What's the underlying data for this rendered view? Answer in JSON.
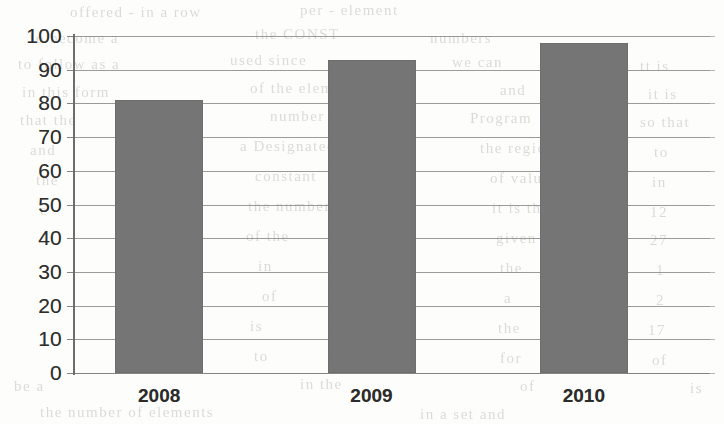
{
  "chart_data": {
    "type": "bar",
    "title": "",
    "subtitle": "",
    "xlabel": "",
    "ylabel": "",
    "categories": [
      "2008",
      "2009",
      "2010"
    ],
    "values": [
      81,
      93,
      98
    ],
    "series": [
      {
        "name": "",
        "values": [
          81,
          93,
          98
        ]
      }
    ],
    "ylim": [
      0,
      100
    ],
    "ytick_step": 10,
    "yticks": [
      100,
      90,
      80,
      70,
      60,
      50,
      40,
      30,
      20,
      10,
      0
    ],
    "ytick_labels": [
      "100",
      "90",
      "80",
      "70",
      "60",
      "50",
      "40",
      "30",
      "20",
      "10",
      "0"
    ],
    "grid": true,
    "grid_axis": "y",
    "legend": false,
    "legend_position": "none",
    "bar_color": "#757575",
    "grid_color": "#8a8a86",
    "axis_color": "#6d6d69",
    "background_color": "#fdfdfc",
    "text_color": "#2e2e2c"
  },
  "artifacts": {
    "description": "faint bleed-through text from reverse side of scanned page",
    "lines": [
      {
        "text": "offered - in a row",
        "x": 70,
        "y": 4
      },
      {
        "text": "per - element",
        "x": 300,
        "y": 2
      },
      {
        "text": "to become a",
        "x": 30,
        "y": 30
      },
      {
        "text": "the CONST",
        "x": 255,
        "y": 26
      },
      {
        "text": "numbers",
        "x": 430,
        "y": 30
      },
      {
        "text": "to follow as a",
        "x": 18,
        "y": 56
      },
      {
        "text": "used since",
        "x": 230,
        "y": 52
      },
      {
        "text": "we can",
        "x": 452,
        "y": 54
      },
      {
        "text": "tt is",
        "x": 640,
        "y": 58
      },
      {
        "text": "in this form",
        "x": 22,
        "y": 84
      },
      {
        "text": "of the element",
        "x": 250,
        "y": 80
      },
      {
        "text": "and",
        "x": 500,
        "y": 82
      },
      {
        "text": "it is",
        "x": 648,
        "y": 86
      },
      {
        "text": "that the",
        "x": 20,
        "y": 112
      },
      {
        "text": "number",
        "x": 270,
        "y": 108
      },
      {
        "text": "Program",
        "x": 470,
        "y": 110
      },
      {
        "text": "so that",
        "x": 640,
        "y": 114
      },
      {
        "text": "and",
        "x": 30,
        "y": 142
      },
      {
        "text": "a Designated",
        "x": 240,
        "y": 138
      },
      {
        "text": "the region",
        "x": 480,
        "y": 140
      },
      {
        "text": "to",
        "x": 654,
        "y": 144
      },
      {
        "text": "the",
        "x": 36,
        "y": 172
      },
      {
        "text": "constant",
        "x": 255,
        "y": 168
      },
      {
        "text": "of values",
        "x": 490,
        "y": 170
      },
      {
        "text": "in",
        "x": 652,
        "y": 174
      },
      {
        "text": "e",
        "x": 40,
        "y": 202
      },
      {
        "text": "the number",
        "x": 248,
        "y": 198
      },
      {
        "text": "it is the",
        "x": 492,
        "y": 200
      },
      {
        "text": "12",
        "x": 650,
        "y": 204
      },
      {
        "text": "of the",
        "x": 246,
        "y": 228
      },
      {
        "text": "given",
        "x": 496,
        "y": 230
      },
      {
        "text": "27",
        "x": 650,
        "y": 232
      },
      {
        "text": "in",
        "x": 258,
        "y": 258
      },
      {
        "text": "the",
        "x": 500,
        "y": 260
      },
      {
        "text": "1",
        "x": 656,
        "y": 262
      },
      {
        "text": "of",
        "x": 262,
        "y": 288
      },
      {
        "text": "a",
        "x": 504,
        "y": 290
      },
      {
        "text": "2",
        "x": 656,
        "y": 292
      },
      {
        "text": "is",
        "x": 250,
        "y": 318
      },
      {
        "text": "the",
        "x": 498,
        "y": 320
      },
      {
        "text": "17",
        "x": 648,
        "y": 322
      },
      {
        "text": "to",
        "x": 254,
        "y": 348
      },
      {
        "text": "for",
        "x": 500,
        "y": 350
      },
      {
        "text": "of",
        "x": 652,
        "y": 352
      },
      {
        "text": "be a",
        "x": 14,
        "y": 378
      },
      {
        "text": "in the",
        "x": 300,
        "y": 376
      },
      {
        "text": "of",
        "x": 520,
        "y": 378
      },
      {
        "text": "is",
        "x": 690,
        "y": 380
      },
      {
        "text": "the number of elements",
        "x": 40,
        "y": 404
      },
      {
        "text": "in a set and",
        "x": 420,
        "y": 406
      }
    ]
  }
}
